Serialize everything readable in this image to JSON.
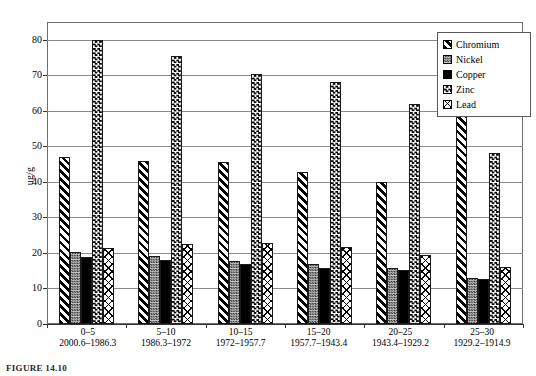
{
  "chart_data": {
    "type": "bar",
    "title": "",
    "xlabel": "",
    "ylabel": "ug/g",
    "ylim": [
      0,
      85
    ],
    "yticks": [
      0,
      10,
      20,
      30,
      40,
      50,
      60,
      70,
      80
    ],
    "grid": true,
    "legend_position": "top-right",
    "categories": [
      "0-5",
      "5-10",
      "10-15",
      "15-20",
      "20-25",
      "25-30"
    ],
    "category_sublabels": [
      "2000.6–1986.3",
      "1986.3–1972",
      "1972–1957.7",
      "1957.7–1943.4",
      "1943.4–1929.2",
      "1929.2–1914.9"
    ],
    "series": [
      {
        "name": "Chromium",
        "pattern": "diagonal-hatch",
        "values": [
          47.0,
          46.0,
          45.6,
          42.8,
          40.0,
          79.5
        ]
      },
      {
        "name": "Nickel",
        "pattern": "fine-checker",
        "values": [
          20.4,
          19.1,
          17.8,
          17.0,
          15.8,
          13.0
        ]
      },
      {
        "name": "Copper",
        "pattern": "solid-black",
        "values": [
          19.0,
          18.0,
          17.0,
          15.7,
          15.2,
          12.7
        ]
      },
      {
        "name": "Zinc",
        "pattern": "coarse-checker",
        "values": [
          80.0,
          75.5,
          70.3,
          68.0,
          62.0,
          48.0
        ]
      },
      {
        "name": "Lead",
        "pattern": "cross-diagonal",
        "values": [
          21.3,
          22.5,
          22.7,
          21.8,
          19.5,
          16.0
        ]
      }
    ]
  },
  "legend": {
    "items": [
      {
        "label": "Chromium"
      },
      {
        "label": "Nickel"
      },
      {
        "label": "Copper"
      },
      {
        "label": "Zinc"
      },
      {
        "label": "Lead"
      }
    ]
  },
  "caption": {
    "text": "FIGURE 14.10"
  }
}
